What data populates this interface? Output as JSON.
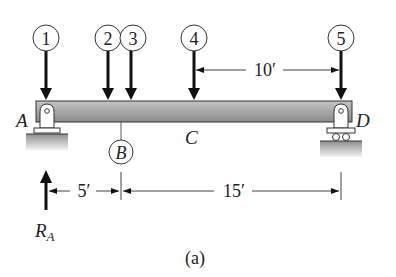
{
  "diagram": {
    "caption": "(a)",
    "beam": {
      "color_top": "#b9b9b9",
      "color_bottom": "#8d8d8d",
      "outline": "#333333"
    },
    "loads": [
      {
        "id": "1",
        "x": 46
      },
      {
        "id": "2",
        "x": 108
      },
      {
        "id": "3",
        "x": 132
      },
      {
        "id": "4",
        "x": 194
      },
      {
        "id": "5",
        "x": 341
      }
    ],
    "points": {
      "A": "A",
      "B": "B",
      "C": "C",
      "D": "D"
    },
    "reaction": {
      "label_main": "R",
      "label_sub": "A"
    },
    "dimensions": {
      "top": "10′",
      "bottom_left": "5′",
      "bottom_right": "15′"
    }
  }
}
